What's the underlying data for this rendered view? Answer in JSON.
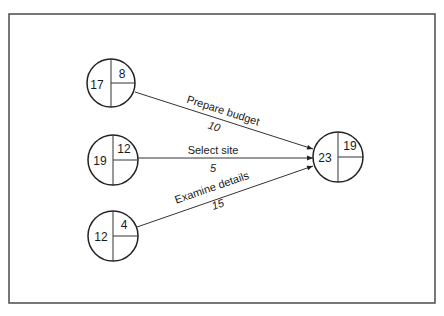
{
  "diagram": {
    "type": "activity-on-arrow network",
    "frame": {
      "x": 9,
      "y": 14,
      "width": 426,
      "height": 289,
      "stroke": "#555555"
    },
    "nodes": [
      {
        "id": "n1",
        "left": "17",
        "right_top": "8",
        "cx": 111,
        "cy": 83,
        "r": 24
      },
      {
        "id": "n2",
        "left": "19",
        "right_top": "12",
        "cx": 113,
        "cy": 160,
        "r": 25
      },
      {
        "id": "n3",
        "left": "12",
        "right_top": "4",
        "cx": 113,
        "cy": 236,
        "r": 25
      },
      {
        "id": "n4",
        "left": "23",
        "right_top": "19",
        "cx": 338,
        "cy": 157,
        "r": 25
      }
    ],
    "edges": [
      {
        "from": "n1",
        "to": "n4",
        "label": "Prepare budget",
        "duration": "10"
      },
      {
        "from": "n2",
        "to": "n4",
        "label": "Select site",
        "duration": "5"
      },
      {
        "from": "n3",
        "to": "n4",
        "label": "Examine details",
        "duration": "15"
      }
    ],
    "colors": {
      "line": "#222222",
      "text": "#1a1a1a",
      "background": "#ffffff"
    }
  }
}
